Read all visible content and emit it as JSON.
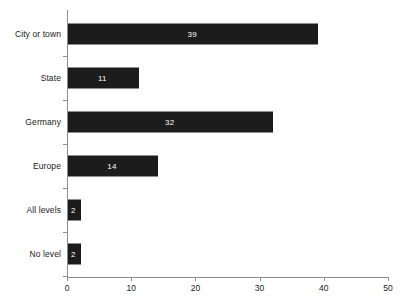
{
  "chart_data": {
    "type": "bar",
    "orientation": "horizontal",
    "title": "",
    "subtitle": "",
    "xlabel": "",
    "ylabel": "",
    "categories": [
      "City or town",
      "State",
      "Germany",
      "Europe",
      "All levels",
      "No level"
    ],
    "values": [
      39,
      11,
      32,
      14,
      2,
      2
    ],
    "value_labels": [
      "39",
      "11",
      "32",
      "14",
      "2",
      "2"
    ],
    "xlim": [
      0,
      50
    ],
    "xticks": [
      0,
      10,
      20,
      30,
      40,
      50
    ],
    "xtick_labels": [
      "0",
      "10",
      "20",
      "30",
      "40",
      "50"
    ],
    "grid": false,
    "legend": null,
    "bar_color": "#1c1c1c",
    "value_label_color": "#ffffff",
    "axis_color": "#8c8c8c",
    "text_color": "#1a1a1a",
    "background": "#ffffff"
  }
}
